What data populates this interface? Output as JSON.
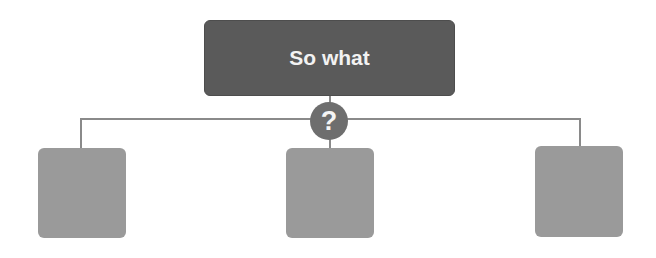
{
  "diagram": {
    "type": "tree",
    "root": {
      "label": "So what",
      "color": "#5a5a5a"
    },
    "connector_badge": {
      "icon": "question-mark-icon",
      "glyph": "?",
      "color": "#6e6e6e"
    },
    "children": [
      {
        "label": "",
        "color": "#9a9a9a"
      },
      {
        "label": "",
        "color": "#9a9a9a"
      },
      {
        "label": "",
        "color": "#9a9a9a"
      }
    ],
    "line_color": "#8a8a8a"
  }
}
